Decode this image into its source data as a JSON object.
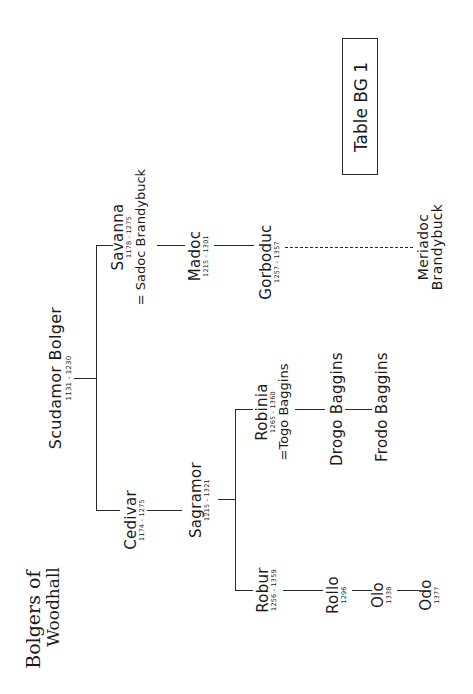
{
  "title": {
    "line1": "Bolgers of",
    "line2": "Woodhall"
  },
  "table_label": "Table BG 1",
  "root": {
    "name": "Scudamor Bolger",
    "dates": "1131 - 1230"
  },
  "people": {
    "savanna": {
      "name": "Savanna",
      "dates": "1178 - 1275",
      "spouse": "= Sadoc Brandybuck"
    },
    "madoc": {
      "name": "Madoc",
      "dates": "1215 - 1301"
    },
    "gorboduc": {
      "name": "Gorboduc",
      "dates": "1257 - 1357"
    },
    "meriadoc": {
      "name1": "Meriadoc",
      "name2": "Brandybuck"
    },
    "cedivar": {
      "name": "Cedivar",
      "dates": "1174 - 1275"
    },
    "sagramor": {
      "name": "Sagramor",
      "dates": "1215 - 1321"
    },
    "robinia": {
      "name": "Robinia",
      "dates": "1265 - 1360",
      "spouse": "=Togo Baggins"
    },
    "drogo": {
      "name": "Drogo Baggins"
    },
    "frodo": {
      "name": "Frodo Baggins"
    },
    "robur": {
      "name": "Robur",
      "dates": "1256 - 1359"
    },
    "rollo": {
      "name": "Rollo",
      "dates": "1296"
    },
    "olo": {
      "name": "Olo",
      "dates": "1338"
    },
    "odo": {
      "name": "Odo",
      "dates": "1377"
    }
  }
}
